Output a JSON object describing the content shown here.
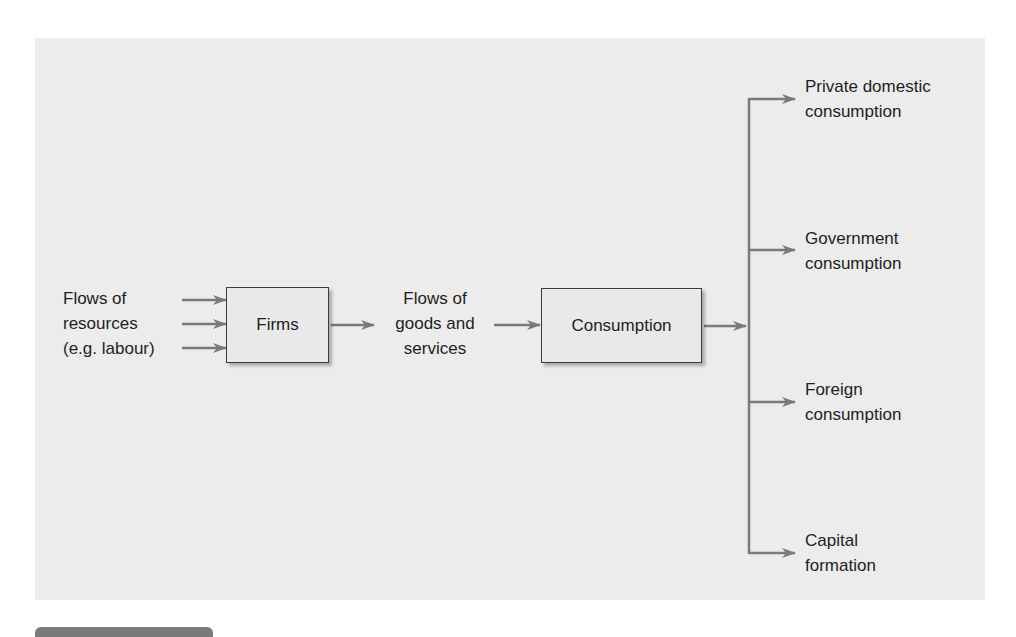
{
  "diagram": {
    "inputs_label": "Flows of\nresources\n(e.g. labour)",
    "firms_box": "Firms",
    "middle_label": "Flows of\ngoods and\nservices",
    "consumption_box": "Consumption",
    "outputs": [
      {
        "label": "Private domestic\nconsumption"
      },
      {
        "label": "Government\nconsumption"
      },
      {
        "label": "Foreign\nconsumption"
      },
      {
        "label": "Capital\nformation"
      }
    ],
    "colors": {
      "panel": "#ececec",
      "arrow": "#7a7a7a",
      "box_border": "#3a3a3a",
      "text": "#1e1e1e"
    }
  }
}
